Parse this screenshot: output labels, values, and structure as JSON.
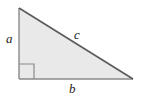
{
  "figure": {
    "kind": "right-triangle-diagram",
    "background_color": "#ffffff",
    "fill_color": "#e9e9e9",
    "stroke_color": "#8a8a8a",
    "hypotenuse_stroke_color": "#5a5a5a",
    "label_color": "#1d1d1d",
    "labels": {
      "leg_vertical": "a",
      "hypotenuse": "c",
      "leg_horizontal": "b"
    },
    "right_angle_marker": {
      "name": "right-angle-marker",
      "size_px": 15,
      "at_vertex": "bottom-left"
    },
    "geometry": {
      "apex": [
        19,
        8
      ],
      "bottom_left": [
        19,
        79
      ],
      "bottom_right": [
        133,
        79
      ]
    }
  }
}
